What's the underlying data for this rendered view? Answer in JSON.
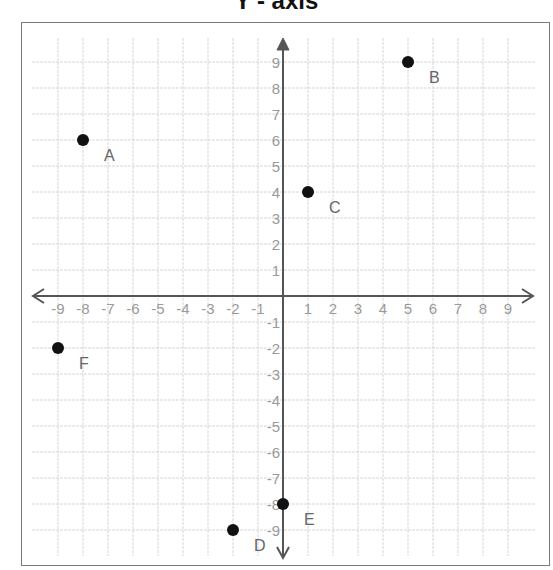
{
  "title": "Y - axis",
  "chart_data": {
    "type": "scatter",
    "title": "Y - axis",
    "xlabel": "",
    "ylabel": "Y - axis",
    "xlim": [
      -9,
      9
    ],
    "ylim": [
      -9,
      9
    ],
    "grid": true,
    "x_ticks": [
      -9,
      -8,
      -7,
      -6,
      -5,
      -4,
      -3,
      -2,
      -1,
      1,
      2,
      3,
      4,
      5,
      6,
      7,
      8,
      9
    ],
    "y_ticks": [
      -9,
      -8,
      -7,
      -6,
      -5,
      -4,
      -3,
      -2,
      -1,
      1,
      2,
      3,
      4,
      5,
      6,
      7,
      8,
      9
    ],
    "points": [
      {
        "label": "A",
        "x": -8,
        "y": 6
      },
      {
        "label": "B",
        "x": 5,
        "y": 9
      },
      {
        "label": "C",
        "x": 1,
        "y": 4
      },
      {
        "label": "D",
        "x": -2,
        "y": -9
      },
      {
        "label": "E",
        "x": 0,
        "y": -8
      },
      {
        "label": "F",
        "x": -9,
        "y": -2
      }
    ]
  },
  "colors": {
    "point": "#111111",
    "axis": "#555555",
    "grid": "#d6d6d6",
    "tick_label": "#9a9a9a",
    "point_label": "#666666"
  }
}
